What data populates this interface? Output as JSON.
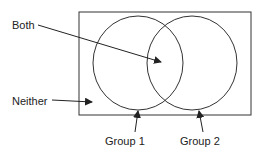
{
  "diagram": {
    "type": "venn",
    "labels": {
      "both": "Both",
      "neither": "Neither",
      "group1": "Group 1",
      "group2": "Group 2"
    },
    "colors": {
      "stroke": "#333333",
      "text": "#222222",
      "background": "#ffffff"
    }
  }
}
